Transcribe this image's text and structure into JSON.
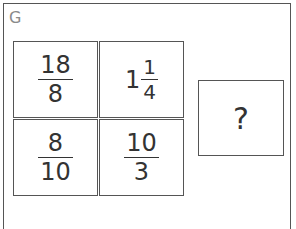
{
  "panel": {
    "label": "G"
  },
  "grid": {
    "cells": [
      {
        "type": "fraction",
        "numerator": "18",
        "denominator": "8"
      },
      {
        "type": "mixed",
        "whole": "1",
        "numerator": "1",
        "denominator": "4"
      },
      {
        "type": "fraction",
        "numerator": "8",
        "denominator": "10"
      },
      {
        "type": "fraction",
        "numerator": "10",
        "denominator": "3"
      }
    ]
  },
  "answer_box": {
    "text": "?"
  }
}
